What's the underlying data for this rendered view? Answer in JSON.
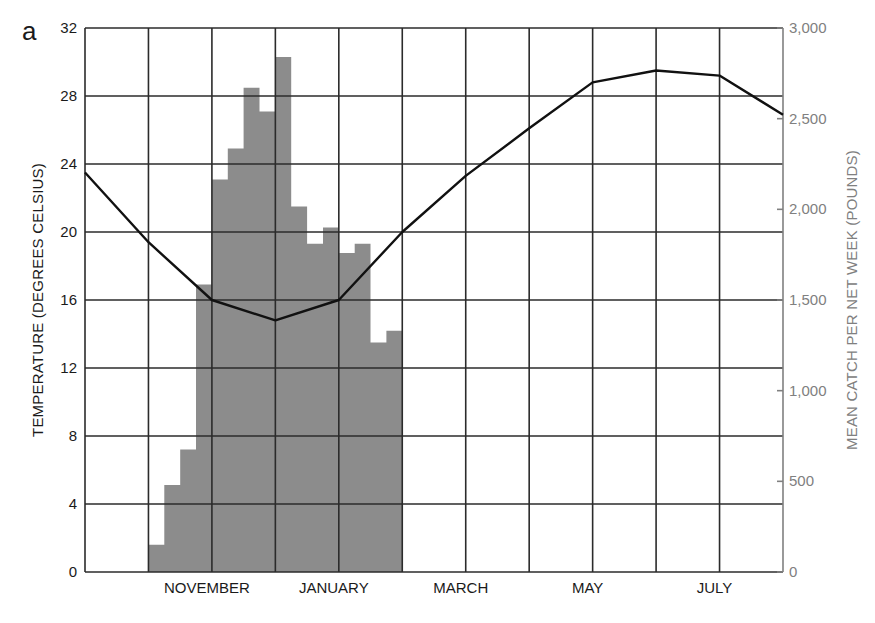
{
  "figure": {
    "panel_letter": "a",
    "left_axis_label": "TEMPERATURE (DEGREES CELSIUS)",
    "right_axis_label": "MEAN CATCH PER NET WEEK (POUNDS)"
  },
  "colors": {
    "grid": "#2b2b2b",
    "bars": "#8c8c8c",
    "line": "#111111",
    "right_axis": "#808080",
    "text": "#1a1a1a"
  },
  "chart_data": {
    "type": "bar+line",
    "title": "",
    "xlabel": "",
    "ylabel_left": "TEMPERATURE (DEGREES CELSIUS)",
    "ylabel_right": "MEAN CATCH PER NET WEEK (POUNDS)",
    "x_tick_labels": [
      "NOVEMBER",
      "JANUARY",
      "MARCH",
      "MAY",
      "JULY"
    ],
    "x_months_grid": [
      "Sep",
      "Oct",
      "Nov",
      "Dec",
      "Jan",
      "Feb",
      "Mar",
      "Apr",
      "May",
      "Jun",
      "Jul",
      "Aug"
    ],
    "y_left": {
      "ticks": [
        0,
        4,
        8,
        12,
        16,
        20,
        24,
        28,
        32
      ],
      "ylim": [
        0,
        32
      ]
    },
    "y_right": {
      "ticks": [
        "0",
        "500",
        "1,000",
        "1,500",
        "2,000",
        "2,500",
        "3,000"
      ],
      "ylim": [
        0,
        3000
      ]
    },
    "grid": true,
    "series": [
      {
        "name": "Mean catch per net week (pounds)",
        "kind": "bar",
        "axis": "right",
        "x_start_month_index": 1,
        "bin_width_months": 0.25,
        "values": [
          150,
          480,
          675,
          1585,
          2165,
          2335,
          2670,
          2540,
          2840,
          2015,
          1810,
          1900,
          1760,
          1810,
          1265,
          1330
        ]
      },
      {
        "name": "Temperature (degrees Celsius)",
        "kind": "line",
        "axis": "left",
        "x_month_index": [
          0,
          1,
          2,
          3,
          4,
          5,
          6,
          7,
          8,
          9,
          10,
          11
        ],
        "values": [
          23.5,
          19.4,
          16.0,
          14.8,
          16.0,
          20.0,
          23.3,
          26.1,
          28.8,
          29.5,
          29.2,
          26.9
        ]
      }
    ]
  }
}
